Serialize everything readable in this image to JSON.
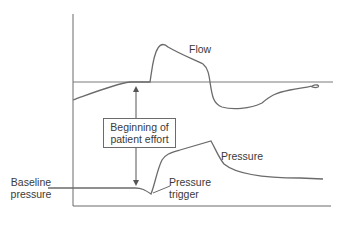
{
  "diagram": {
    "type": "ventilator waveform (pressure triggering)",
    "curves": [
      {
        "name": "flow",
        "label": "Flow"
      },
      {
        "name": "pressure",
        "label": "Pressure"
      }
    ],
    "annotations": {
      "flow_label": "Flow",
      "pressure_label": "Pressure",
      "effort_box_line1": "Beginning of",
      "effort_box_line2": "patient effort",
      "baseline_line1": "Baseline",
      "baseline_line2": "pressure",
      "trigger_line1": "Pressure",
      "trigger_line2": "trigger"
    },
    "colors": {
      "line": "#6b6b6b",
      "text": "#3a3a3a",
      "background": "#ffffff"
    }
  }
}
